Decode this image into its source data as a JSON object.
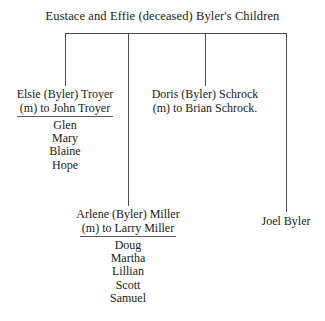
{
  "diagram": {
    "title": "Eustace and Effie (deceased) Byler's Children",
    "branches": [
      {
        "id": "elsie",
        "name": "Elsie (Byler) Troyer",
        "spouse": "(m) to John Troyer",
        "children": [
          "Glen",
          "Mary",
          "Blaine",
          "Hope"
        ]
      },
      {
        "id": "doris",
        "name": "Doris (Byler) Schrock",
        "spouse": "(m) to Brian Schrock.",
        "children": []
      },
      {
        "id": "arlene",
        "name": "Arlene (Byler) Miller",
        "spouse": "(m) to Larry Miller",
        "children": [
          "Doug",
          "Martha",
          "Lillian",
          "Scott",
          "Samuel"
        ]
      },
      {
        "id": "joel",
        "name": "Joel Byler",
        "spouse": "",
        "children": []
      }
    ]
  },
  "colors": {
    "background": "#ffffff",
    "text": "#1a1a1a",
    "rule": "#4d4d4d"
  }
}
